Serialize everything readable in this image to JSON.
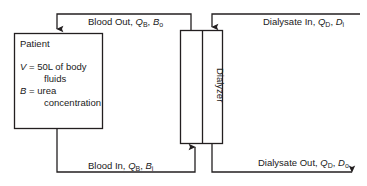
{
  "diagram": {
    "stroke_color": "#231f20",
    "background_color": "#ffffff",
    "patient_box": {
      "name": "Patient",
      "lines": [
        {
          "symbol": "V",
          "relation": "=",
          "value": "50L of body",
          "cont": "fluids"
        },
        {
          "symbol": "B",
          "relation": "=",
          "value": "urea",
          "cont": "concentration"
        }
      ]
    },
    "dialyzer_box": {
      "label": "Dialyzer"
    },
    "flows": {
      "blood_out": {
        "text_main": "Blood Out, ",
        "q_symbol": "Q",
        "q_sub": "B",
        "sep": ", ",
        "c_symbol": "B",
        "c_sub": "o"
      },
      "blood_in": {
        "text_main": "Blood In, ",
        "q_symbol": "Q",
        "q_sub": "B",
        "sep": ", ",
        "c_symbol": "B",
        "c_sub": "i"
      },
      "dialysate_in": {
        "text_main": "Dialysate In, ",
        "q_symbol": "Q",
        "q_sub": "D",
        "sep": ", ",
        "c_symbol": "D",
        "c_sub": "i"
      },
      "dialysate_out": {
        "text_main": "Dialysate Out, ",
        "q_symbol": "Q",
        "q_sub": "D",
        "sep": ", ",
        "c_symbol": "D",
        "c_sub": "o"
      }
    }
  }
}
